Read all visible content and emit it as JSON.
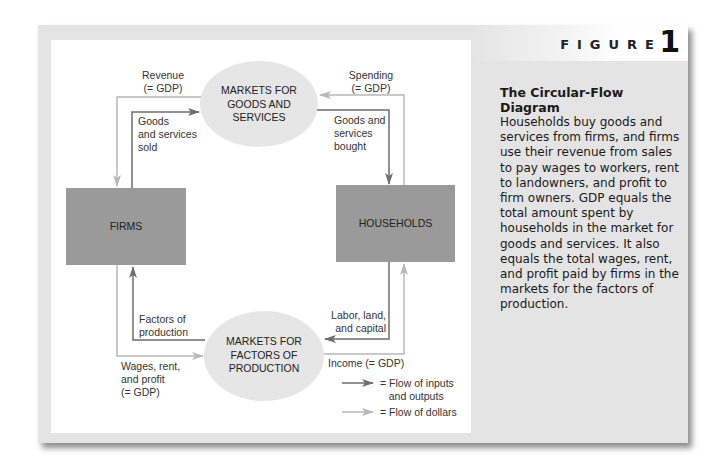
{
  "figure": {
    "label": "FIGURE",
    "number": "1"
  },
  "caption": {
    "title": "The Circular-Flow Diagram",
    "body": "Households buy goods and services from firms, and firms use their revenue from sales to pay wages to workers, rent to landowners, and profit to firm owners. GDP equals the total amount spent by households in the market for goods and services. It also equals the total wages, rent, and profit paid by firms in the markets for the factors of production."
  },
  "nodes": {
    "firms": "FIRMS",
    "households": "HOUSEHOLDS",
    "goods_market": "MARKETS FOR\nGOODS AND\nSERVICES",
    "factor_market": "MARKETS FOR\nFACTORS OF\nPRODUCTION"
  },
  "flows": {
    "revenue": "Revenue\n(= GDP)",
    "goods_sold": "Goods\nand services\nsold",
    "spending": "Spending\n(= GDP)",
    "goods_bought": "Goods and\nservices\nbought",
    "factors": "Factors of\nproduction",
    "wages": "Wages, rent,\nand profit\n(= GDP)",
    "labor": "Labor, land,\nand capital",
    "income": "Income (= GDP)"
  },
  "legend": {
    "inputs_outputs": "= Flow of inputs\n   and outputs",
    "dollars": "= Flow of dollars"
  },
  "colors": {
    "real_flow": "#6e6e6e",
    "money_flow": "#b8b8b8",
    "box_fill": "#9a9a9a",
    "ellipse_fill": "#e6e6e6",
    "panel_bg": "#e4e4e4"
  }
}
